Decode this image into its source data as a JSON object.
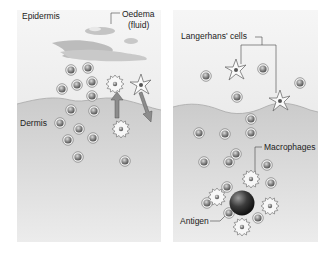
{
  "panels": {
    "left": {
      "label_epidermis": "Epidermis",
      "label_dermis": "Dermis",
      "label_oedema_1": "Oedema",
      "label_oedema_2": "(fluid)"
    },
    "right": {
      "label_langerhans": "Langerhans' cells",
      "label_macrophages": "Macrophages",
      "label_antigen": "Antigen"
    }
  },
  "colors": {
    "epidermis_top": "#f3f3f3",
    "epidermis_bottom": "#e4e4e4",
    "dermis": "#cfcfcf",
    "dermis_line": "#a9a9a9",
    "cell": "#8f8f8f",
    "cell_ring": "#e8e8e8",
    "fluid": "#bdbdbd",
    "antigen": "#3a3a3a"
  },
  "cells": {
    "left_lymphocytes": [
      [
        71,
        70
      ],
      [
        88,
        68
      ],
      [
        62,
        89
      ],
      [
        77,
        85
      ],
      [
        92,
        82
      ],
      [
        92,
        96
      ],
      [
        71,
        110
      ],
      [
        94,
        111
      ],
      [
        60,
        123
      ],
      [
        79,
        129
      ],
      [
        68,
        140
      ],
      [
        93,
        138
      ],
      [
        78,
        157
      ],
      [
        125,
        161
      ]
    ],
    "right_lymphocytes": [
      [
        206,
        76
      ],
      [
        263,
        69
      ],
      [
        300,
        83
      ],
      [
        237,
        97
      ],
      [
        251,
        119
      ],
      [
        199,
        133
      ],
      [
        225,
        134
      ],
      [
        251,
        133
      ],
      [
        236,
        154
      ],
      [
        204,
        162
      ],
      [
        229,
        162
      ],
      [
        267,
        165
      ],
      [
        271,
        183
      ],
      [
        207,
        203
      ],
      [
        227,
        187
      ],
      [
        229,
        213
      ],
      [
        258,
        218
      ]
    ],
    "left_langerhans": [
      [
        141,
        85
      ]
    ],
    "right_langerhans": [
      [
        236,
        70
      ],
      [
        280,
        101
      ]
    ],
    "left_macrophages": [
      [
        115,
        84
      ],
      [
        121,
        129
      ]
    ],
    "right_macrophages": [
      [
        251,
        179
      ],
      [
        217,
        197
      ],
      [
        270,
        206
      ],
      [
        242,
        227
      ]
    ]
  }
}
